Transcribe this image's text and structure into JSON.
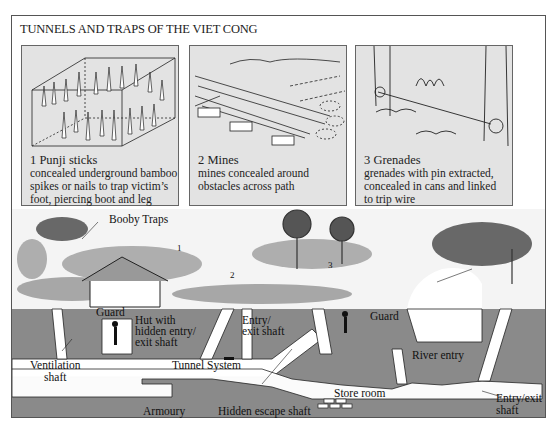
{
  "title": "TUNNELS AND TRAPS OF THE VIET CONG",
  "panels": [
    {
      "number": "1",
      "name": "Punji sticks",
      "heading": "1  Punji sticks",
      "lines": [
        "concealed underground bamboo",
        "spikes or nails to trap victim’s",
        "foot, piercing boot and leg"
      ]
    },
    {
      "number": "2",
      "name": "Mines",
      "heading": "2  Mines",
      "lines": [
        "mines concealed around",
        "obstacles across path"
      ]
    },
    {
      "number": "3",
      "name": "Grenades",
      "heading": "3  Grenades",
      "lines": [
        "grenades with pin extracted,",
        "concealed in cans and linked",
        "to trip wire"
      ]
    }
  ],
  "scene": {
    "labels": {
      "booby_traps": "Booby Traps",
      "trap_1": "1",
      "trap_2": "2",
      "trap_3": "3",
      "guard_hut": "Guard",
      "hut_entry_1": "Hut with",
      "hut_entry_2": "hidden entry/",
      "hut_entry_3": "exit shaft",
      "entry_exit_1": "Entry/",
      "entry_exit_2": "exit shaft",
      "guard_tunnel": "Guard",
      "ventilation_1": "Ventilation",
      "ventilation_2": "shaft",
      "tunnel_system": "Tunnel System",
      "river_entry": "River entry",
      "store_room": "Store room",
      "armoury": "Armoury",
      "hidden_escape": "Hidden escape shaft",
      "entry_exit_right_1": "Entry/exit",
      "entry_exit_right_2": "shaft"
    },
    "colors": {
      "earth": "#8a8a8a",
      "tunnel": "#ffffff",
      "panel_bg": "#e3e3e3",
      "foliage": "#2a2a2a"
    }
  }
}
